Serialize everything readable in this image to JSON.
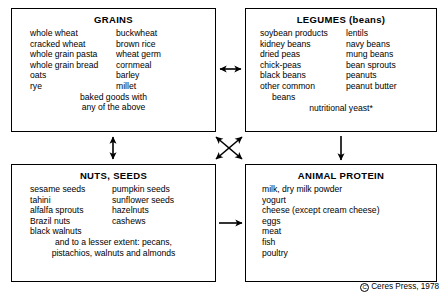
{
  "diagram": {
    "boxes": [
      {
        "id": "grains",
        "title": "GRAINS",
        "column1": [
          "whole wheat",
          "cracked wheat",
          "whole grain pasta",
          "whole grain bread",
          "oats",
          "rye"
        ],
        "column2": [
          "buckwheat",
          "brown rice",
          "wheat germ",
          "cornmeal",
          "barley",
          "millet"
        ],
        "footer_lines": [
          "baked goods with",
          "any of the above"
        ]
      },
      {
        "id": "legumes",
        "title": "LEGUMES (beans)",
        "column1": [
          "soybean products",
          "kidney beans",
          "dried peas",
          "chick-peas",
          "black beans",
          "other common",
          "beans"
        ],
        "column2": [
          "lentils",
          "navy beans",
          "mung beans",
          "bean sprouts",
          "peanuts",
          "peanut butter"
        ],
        "footer_lines": [
          "nutritional yeast*"
        ]
      },
      {
        "id": "nuts",
        "title": "NUTS, SEEDS",
        "column1": [
          "sesame seeds",
          "tahini",
          "alfalfa sprouts",
          "Brazil nuts",
          "black walnuts"
        ],
        "column2": [
          "pumpkin seeds",
          "sunflower seeds",
          "hazelnuts",
          "cashews"
        ],
        "footer_lines": [
          "and to a lesser extent: pecans,",
          "pistachios, walnuts and almonds"
        ]
      },
      {
        "id": "animal",
        "title": "ANIMAL PROTEIN",
        "column1": [
          "milk, dry milk powder",
          "yogurt",
          "cheese (except cream cheese)",
          "eggs",
          "meat",
          "fish",
          "poultry"
        ],
        "column2": [],
        "footer_lines": []
      }
    ],
    "arrows": [
      {
        "name": "grains-legumes",
        "direction": "both",
        "orientation": "horizontal"
      },
      {
        "name": "grains-nuts",
        "direction": "both",
        "orientation": "vertical"
      },
      {
        "name": "grains-animal",
        "direction": "both",
        "orientation": "diagonal"
      },
      {
        "name": "legumes-nuts",
        "direction": "both",
        "orientation": "diagonal"
      },
      {
        "name": "legumes-animal",
        "direction": "down",
        "orientation": "vertical"
      },
      {
        "name": "nuts-animal",
        "direction": "right",
        "orientation": "horizontal"
      }
    ]
  },
  "copyright": {
    "symbol": "C",
    "text": "Ceres Press, 1978"
  },
  "colors": {
    "ink": "#000000",
    "background": "#ffffff"
  }
}
